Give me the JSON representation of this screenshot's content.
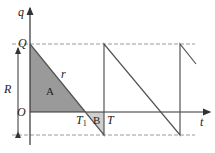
{
  "diagram": {
    "axes": {
      "y_label": "q",
      "x_label": "t",
      "origin_label": "O"
    },
    "levels": {
      "top_label": "Q",
      "range_label": "R"
    },
    "labels": {
      "slope": "r",
      "region_a": "A",
      "region_b": "B",
      "t1": "T",
      "t1_sub": "1",
      "t": "T"
    },
    "colors": {
      "line": "#555555",
      "shade_a": "#9a9a9a",
      "shade_b": "#cfcfcf",
      "dash": "#9a9a9a"
    }
  }
}
